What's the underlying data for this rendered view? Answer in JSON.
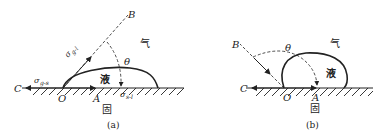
{
  "figure_a": {
    "caption": "(a)",
    "point_B": "B",
    "point_C": "C",
    "point_O": "O",
    "point_A": "A",
    "gas": "气",
    "liquid": "液",
    "solid": "固",
    "theta": "θ",
    "sigma_gl": "σ",
    "sigma_gl_sub": "g-l",
    "sigma_gs": "σ",
    "sigma_gs_sub": "g-s",
    "sigma_sl": "σ",
    "sigma_sl_sub": "s-l"
  },
  "figure_b": {
    "caption": "(b)",
    "point_B": "B",
    "point_C": "C",
    "point_O": "O",
    "point_A": "A",
    "gas": "气",
    "liquid": "液",
    "solid": "固",
    "theta": "θ"
  },
  "colors": {
    "ink": "#222222",
    "background": "#ffffff"
  }
}
